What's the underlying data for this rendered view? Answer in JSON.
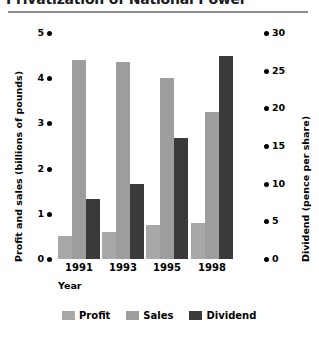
{
  "title": "Privatization of National Power",
  "chart_data": {
    "type": "bar",
    "title": "Privatization of National Power",
    "xlabel": "Year",
    "ylabel": "Profit and sales (billions of pounds)",
    "y2label": "Dividend (pence per share)",
    "categories": [
      "1991",
      "1993",
      "1995",
      "1998"
    ],
    "ylim": [
      0,
      5
    ],
    "y2lim": [
      0,
      30
    ],
    "yticks": [
      "0",
      "1",
      "2",
      "3",
      "4",
      "5"
    ],
    "y2ticks": [
      "0",
      "5",
      "10",
      "15",
      "20",
      "25",
      "30"
    ],
    "grid": false,
    "legend_position": "bottom",
    "series": [
      {
        "name": "Profit",
        "axis": "left",
        "unit": "billions of pounds",
        "color": "#a8a8a8",
        "values": [
          0.5,
          0.6,
          0.75,
          0.8
        ]
      },
      {
        "name": "Sales",
        "axis": "left",
        "unit": "billions of pounds",
        "color": "#9d9d9d",
        "values": [
          4.4,
          4.35,
          4.0,
          3.25
        ]
      },
      {
        "name": "Dividend",
        "axis": "right",
        "unit": "pence per share",
        "color": "#3a3a3a",
        "values": [
          8,
          10,
          16,
          27
        ]
      }
    ]
  },
  "legend": [
    {
      "label": "Profit",
      "color": "#a8a8a8"
    },
    {
      "label": "Sales",
      "color": "#9d9d9d"
    },
    {
      "label": "Dividend",
      "color": "#3a3a3a"
    }
  ],
  "colors": {
    "profit": "#a8a8a8",
    "sales": "#9d9d9d",
    "dividend": "#3a3a3a",
    "rule": "#8e8e8e",
    "text": "#000000"
  }
}
